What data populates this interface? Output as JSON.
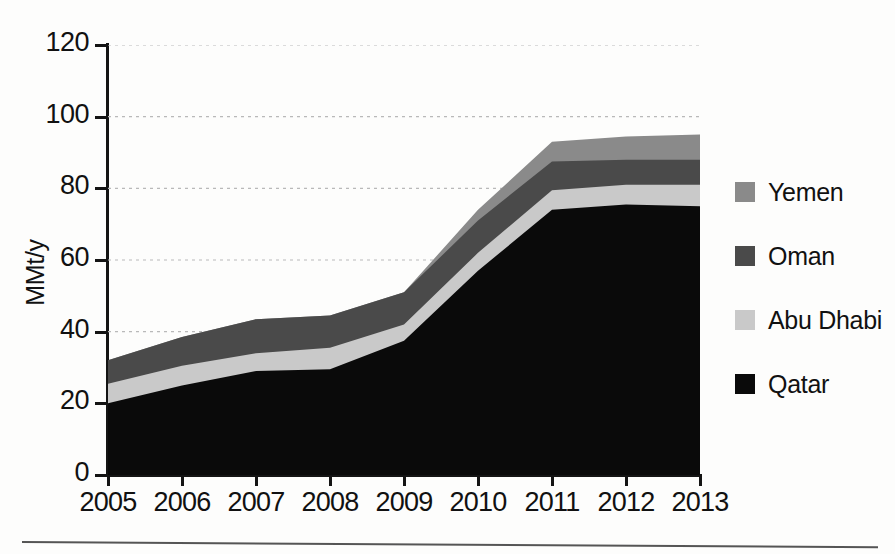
{
  "chart_data": {
    "type": "area",
    "stacked": true,
    "title": "",
    "subtitle": "",
    "xlabel": "",
    "ylabel": "MMt/y",
    "categories": [
      "2005",
      "2006",
      "2007",
      "2008",
      "2009",
      "2010",
      "2011",
      "2012",
      "2013"
    ],
    "x": [
      2005,
      2006,
      2007,
      2008,
      2009,
      2010,
      2011,
      2012,
      2013
    ],
    "xlim": [
      2005,
      2013
    ],
    "ylim": [
      0,
      120
    ],
    "yticks": [
      0,
      20,
      40,
      60,
      80,
      100,
      120
    ],
    "ytick_labels": [
      "0",
      "20",
      "40",
      "60",
      "80",
      "100",
      "120"
    ],
    "grid": true,
    "grid_style": "dotted",
    "grid_axis": "y",
    "legend_position": "right",
    "series": [
      {
        "name": "Qatar",
        "color": "#0a0a0a",
        "values": [
          20,
          25,
          29,
          29.5,
          37.5,
          57,
          74,
          75.5,
          75
        ]
      },
      {
        "name": "Abu Dhabi",
        "color": "#c9c9c9",
        "values": [
          5.5,
          5.5,
          5,
          6,
          4.5,
          5,
          5.5,
          5.5,
          6
        ]
      },
      {
        "name": "Oman",
        "color": "#4a4a4a",
        "values": [
          6.5,
          8,
          9.5,
          9,
          9,
          9,
          8,
          7,
          7
        ]
      },
      {
        "name": "Yemen",
        "color": "#8a8a8a",
        "values": [
          0,
          0,
          0,
          0,
          0,
          3,
          5.5,
          6.5,
          7
        ]
      }
    ],
    "cumulative_tops": {
      "Qatar": [
        20,
        25,
        29,
        29.5,
        37.5,
        57,
        74,
        75.5,
        75
      ],
      "Abu Dhabi": [
        25.5,
        30.5,
        34,
        35.5,
        42,
        62,
        79.5,
        81,
        81
      ],
      "Oman": [
        32,
        38.5,
        43.5,
        44.5,
        51,
        71,
        87.5,
        88,
        88
      ],
      "Yemen": [
        32,
        38.5,
        43.5,
        44.5,
        51,
        74,
        93,
        94.5,
        95
      ]
    }
  },
  "legend": {
    "items": [
      {
        "label": "Yemen",
        "color": "#8a8a8a"
      },
      {
        "label": "Oman",
        "color": "#4a4a4a"
      },
      {
        "label": "Abu Dhabi",
        "color": "#c9c9c9"
      },
      {
        "label": "Qatar",
        "color": "#0a0a0a"
      }
    ]
  },
  "axes": {
    "y_title": "MMt/y",
    "y_labels": [
      "120",
      "100",
      "80",
      "60",
      "40",
      "20",
      "0"
    ],
    "x_labels": [
      "2005",
      "2006",
      "2007",
      "2008",
      "2009",
      "2010",
      "2011",
      "2012",
      "2013"
    ]
  }
}
